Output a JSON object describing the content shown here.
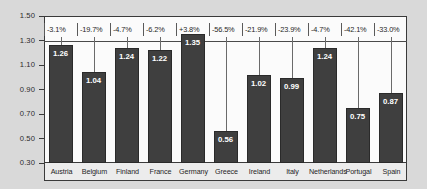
{
  "chart_data": {
    "type": "bar",
    "title": "",
    "xlabel": "",
    "ylabel": "",
    "ylim": [
      0.3,
      1.5
    ],
    "ytick_labels": [
      "1.50",
      "1.30",
      "1.10",
      "0.90",
      "0.70",
      "0.50",
      "0.30"
    ],
    "yticks": [
      1.5,
      1.3,
      1.1,
      0.9,
      0.7,
      0.5,
      0.3
    ],
    "grid": false,
    "reference_line": 1.3,
    "legend": [],
    "categories": [
      "Austria",
      "Belgium",
      "Finland",
      "France",
      "Germany",
      "Greece",
      "Ireland",
      "Italy",
      "Netherlands",
      "Portugal",
      "Spain"
    ],
    "values": [
      1.26,
      1.04,
      1.24,
      1.22,
      1.35,
      0.56,
      1.02,
      0.99,
      1.24,
      0.75,
      0.87
    ],
    "value_labels": [
      "1.26",
      "1.04",
      "1.24",
      "1.22",
      "1.35",
      "0.56",
      "1.02",
      "0.99",
      "1.24",
      "0.75",
      "0.87"
    ],
    "annotations": [
      "-3.1%",
      "-19.7%",
      "-4.7%",
      "-6.2%",
      "+3.8%",
      "-56.5%",
      "-21.9%",
      "-23.9%",
      "-4.7%",
      "-42.1%",
      "-33.0%"
    ],
    "colors": {
      "bar": "#3f3f3f",
      "bar_border": "#2a2a2a",
      "plot_background": "#fbfbfb",
      "page_background": "#d9d9d9",
      "axis": "#3a3a3a",
      "value_label": "#ffffff",
      "annotation": "#1f1f1f",
      "category_band": "#ececec"
    }
  }
}
